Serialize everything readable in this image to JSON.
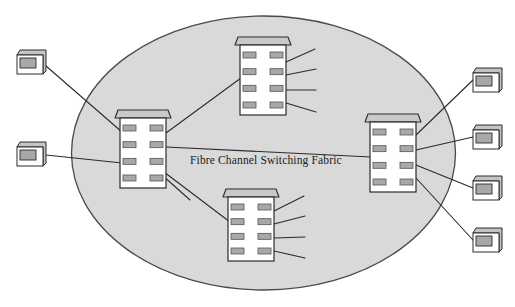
{
  "diagram": {
    "title": "Fibre Channel Switching Fabric",
    "type": "network-topology",
    "canvas": {
      "width": 515,
      "height": 307,
      "background": "#ffffff"
    },
    "fabric_cloud": {
      "label": "Fibre Channel Switching Fabric",
      "shape": "ellipse",
      "cx": 263.5,
      "cy": 153,
      "rx": 192,
      "ry": 137,
      "fill": "#d9d9d9",
      "stroke": "#4a4a4a"
    },
    "label_position": {
      "x": 190,
      "y": 164
    },
    "colors": {
      "cloud_fill": "#d9d9d9",
      "cloud_stroke": "#4a4a4a",
      "switch_body_fill": "#ffffff",
      "switch_stroke": "#2b2b2b",
      "switch_lid_fill": "#c9c9c9",
      "switch_port_fill": "#a8a8a8",
      "switch_port_stroke": "#555555",
      "host_fill": "#ffffff",
      "host_stroke": "#2b2b2b",
      "host_lid_fill": "#c4c4c4",
      "host_screen_fill": "#a8a8a8",
      "link_stroke": "#2b2b2b",
      "text": "#1b1b1b"
    },
    "switches": [
      {
        "id": "switch-left",
        "name": "fabric-switch-left",
        "x": 120,
        "y": 118,
        "w": 46,
        "h": 70,
        "ports_per_side": 4
      },
      {
        "id": "switch-top",
        "name": "fabric-switch-top",
        "x": 240,
        "y": 45,
        "w": 46,
        "h": 70,
        "ports_per_side": 4
      },
      {
        "id": "switch-bottom",
        "name": "fabric-switch-bottom",
        "x": 228,
        "y": 197,
        "w": 46,
        "h": 64,
        "ports_per_side": 4
      },
      {
        "id": "switch-right",
        "name": "fabric-switch-right",
        "x": 370,
        "y": 122,
        "w": 46,
        "h": 70,
        "ports_per_side": 4
      }
    ],
    "hosts": [
      {
        "id": "host-left-1",
        "name": "host-node-left-upper",
        "x": 17,
        "y": 50,
        "w": 29,
        "h": 24
      },
      {
        "id": "host-left-2",
        "name": "host-node-left-lower",
        "x": 17,
        "y": 142,
        "w": 29,
        "h": 24
      },
      {
        "id": "host-right-1",
        "name": "host-node-right-1",
        "x": 473,
        "y": 68,
        "w": 29,
        "h": 24
      },
      {
        "id": "host-right-2",
        "name": "host-node-right-2",
        "x": 473,
        "y": 125,
        "w": 29,
        "h": 24
      },
      {
        "id": "host-right-3",
        "name": "host-node-right-3",
        "x": 473,
        "y": 176,
        "w": 29,
        "h": 24
      },
      {
        "id": "host-right-4",
        "name": "host-node-right-4",
        "x": 473,
        "y": 228,
        "w": 29,
        "h": 24
      }
    ],
    "links": [
      {
        "name": "link-host-left-upper-to-switch-left",
        "x1": 46,
        "y1": 66,
        "x2": 122,
        "y2": 132
      },
      {
        "name": "link-host-left-lower-to-switch-left",
        "x1": 46,
        "y1": 155,
        "x2": 122,
        "y2": 163
      },
      {
        "name": "link-switch-left-to-switch-top",
        "x1": 166,
        "y1": 133,
        "x2": 241,
        "y2": 78
      },
      {
        "name": "link-switch-left-to-switch-bottom",
        "x1": 164,
        "y1": 172,
        "x2": 230,
        "y2": 222
      },
      {
        "name": "link-switch-left-to-switch-right",
        "x1": 166,
        "y1": 147,
        "x2": 371,
        "y2": 157
      },
      {
        "name": "link-switch-left-stub",
        "x1": 162,
        "y1": 175,
        "x2": 190,
        "y2": 200
      },
      {
        "name": "link-switch-top-stub-1",
        "x1": 286,
        "y1": 62,
        "x2": 315,
        "y2": 49
      },
      {
        "name": "link-switch-top-stub-2",
        "x1": 286,
        "y1": 75,
        "x2": 316,
        "y2": 69
      },
      {
        "name": "link-switch-top-stub-3",
        "x1": 286,
        "y1": 90,
        "x2": 316,
        "y2": 90
      },
      {
        "name": "link-switch-top-stub-4",
        "x1": 286,
        "y1": 103,
        "x2": 316,
        "y2": 112
      },
      {
        "name": "link-switch-bottom-stub-1",
        "x1": 274,
        "y1": 211,
        "x2": 304,
        "y2": 196
      },
      {
        "name": "link-switch-bottom-stub-2",
        "x1": 274,
        "y1": 224,
        "x2": 305,
        "y2": 216
      },
      {
        "name": "link-switch-bottom-stub-3",
        "x1": 274,
        "y1": 238,
        "x2": 305,
        "y2": 237
      },
      {
        "name": "link-switch-bottom-stub-4",
        "x1": 274,
        "y1": 251,
        "x2": 305,
        "y2": 258
      },
      {
        "name": "link-switch-right-to-host-right-1",
        "x1": 416,
        "y1": 135,
        "x2": 473,
        "y2": 80
      },
      {
        "name": "link-switch-right-to-host-right-2",
        "x1": 416,
        "y1": 150,
        "x2": 473,
        "y2": 137
      },
      {
        "name": "link-switch-right-to-host-right-3",
        "x1": 416,
        "y1": 165,
        "x2": 473,
        "y2": 188
      },
      {
        "name": "link-switch-right-to-host-right-4",
        "x1": 416,
        "y1": 178,
        "x2": 473,
        "y2": 240
      }
    ]
  }
}
